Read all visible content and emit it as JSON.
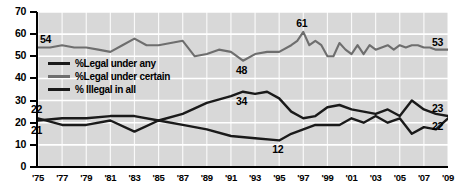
{
  "chart_data": {
    "type": "line",
    "title": "",
    "subtitle": "",
    "xlabel": "",
    "ylabel": "",
    "xlim": [
      1975,
      2009
    ],
    "ylim": [
      0,
      70
    ],
    "grid": true,
    "legend_position": "inside-left",
    "y_ticks": [
      "0",
      "10",
      "20",
      "30",
      "40",
      "50",
      "60",
      "70"
    ],
    "y_tick_values": [
      0,
      10,
      20,
      30,
      40,
      50,
      60,
      70
    ],
    "x_ticks": [
      "'75",
      "'77",
      "'79",
      "'81",
      "'83",
      "'85",
      "'87",
      "'89",
      "'91",
      "'93",
      "'95",
      "'97",
      "'99",
      "'01",
      "'03",
      "'05",
      "'07",
      "'09"
    ],
    "x_tick_values": [
      1975,
      1977,
      1979,
      1981,
      1983,
      1985,
      1987,
      1989,
      1991,
      1993,
      1995,
      1997,
      1999,
      2001,
      2003,
      2005,
      2007,
      2009
    ],
    "series": [
      {
        "name": "%Legal under certain",
        "color": "#6e6e6e",
        "x": [
          1975,
          1976,
          1977,
          1978,
          1979,
          1980,
          1981,
          1982,
          1983,
          1984,
          1985,
          1986,
          1987,
          1988,
          1989,
          1990,
          1991,
          1992,
          1993,
          1994,
          1995,
          1996,
          1996.5,
          1997,
          1997.5,
          1998,
          1998.5,
          1999,
          1999.5,
          2000,
          2000.5,
          2001,
          2001.5,
          2002,
          2002.5,
          2003,
          2003.5,
          2004,
          2004.5,
          2005,
          2005.5,
          2006,
          2006.5,
          2007,
          2007.5,
          2008,
          2008.5,
          2009
        ],
        "values": [
          54,
          54,
          55,
          54,
          54,
          53,
          52,
          55,
          58,
          55,
          55,
          56,
          57,
          50,
          51,
          53,
          52,
          48,
          51,
          52,
          52,
          55,
          57,
          61,
          55,
          57,
          55,
          50,
          50,
          56,
          53,
          51,
          55,
          51,
          55,
          53,
          54,
          55,
          53,
          55,
          54,
          55,
          55,
          54,
          54,
          53,
          53,
          53
        ]
      },
      {
        "name": "%Legal under any",
        "color": "#1a1a1a",
        "x": [
          1975,
          1977,
          1979,
          1981,
          1983,
          1985,
          1987,
          1989,
          1991,
          1992,
          1993,
          1994,
          1995,
          1996,
          1997,
          1998,
          1999,
          2000,
          2001,
          2002,
          2003,
          2004,
          2005,
          2006,
          2007,
          2008,
          2009
        ],
        "values": [
          21,
          22,
          22,
          23,
          23,
          21,
          24,
          29,
          32,
          34,
          33,
          34,
          31,
          25,
          22,
          23,
          27,
          28,
          26,
          25,
          24,
          26,
          23,
          30,
          26,
          24,
          23
        ]
      },
      {
        "name": "% Illegal in all",
        "color": "#1a1a1a",
        "x": [
          1975,
          1977,
          1979,
          1981,
          1983,
          1985,
          1987,
          1989,
          1991,
          1993,
          1995,
          1996,
          1997,
          1998,
          1999,
          2000,
          2001,
          2002,
          2003,
          2004,
          2005,
          2006,
          2007,
          2008,
          2009
        ],
        "values": [
          22,
          19,
          19,
          21,
          16,
          21,
          19,
          17,
          14,
          13,
          12,
          15,
          17,
          19,
          19,
          19,
          22,
          20,
          23,
          20,
          22,
          15,
          18,
          17,
          22
        ]
      }
    ],
    "annotations": [
      {
        "text": "54",
        "x": 1975,
        "y": 54,
        "series": "%Legal under certain",
        "position": "above-right"
      },
      {
        "text": "48",
        "x": 1992,
        "y": 48,
        "series": "%Legal under certain",
        "position": "below"
      },
      {
        "text": "61",
        "x": 1997,
        "y": 61,
        "series": "%Legal under certain",
        "position": "above"
      },
      {
        "text": "53",
        "x": 2009,
        "y": 53,
        "series": "%Legal under certain",
        "position": "above-left"
      },
      {
        "text": "22",
        "x": 1975,
        "y": 22,
        "series": "% Illegal in all",
        "position": "above"
      },
      {
        "text": "21",
        "x": 1975,
        "y": 21,
        "series": "%Legal under any",
        "position": "below"
      },
      {
        "text": "34",
        "x": 1992,
        "y": 34,
        "series": "%Legal under any",
        "position": "below"
      },
      {
        "text": "12",
        "x": 1995,
        "y": 12,
        "series": "% Illegal in all",
        "position": "below"
      },
      {
        "text": "23",
        "x": 2009,
        "y": 23,
        "series": "%Legal under any",
        "position": "above-left"
      },
      {
        "text": "22",
        "x": 2009,
        "y": 22,
        "series": "% Illegal in all",
        "position": "below-left"
      }
    ],
    "legend": [
      {
        "label": "%Legal under any",
        "color": "#1a1a1a"
      },
      {
        "label": "%Legal under certain",
        "color": "#6e6e6e"
      },
      {
        "label": "% Illegal in all",
        "color": "#1a1a1a"
      }
    ],
    "colors": {
      "plot_background": "#d8d8d8",
      "gridline": "#ffffff",
      "axis": "#000000",
      "dark_series": "#1a1a1a",
      "mid_series": "#6e6e6e"
    }
  }
}
